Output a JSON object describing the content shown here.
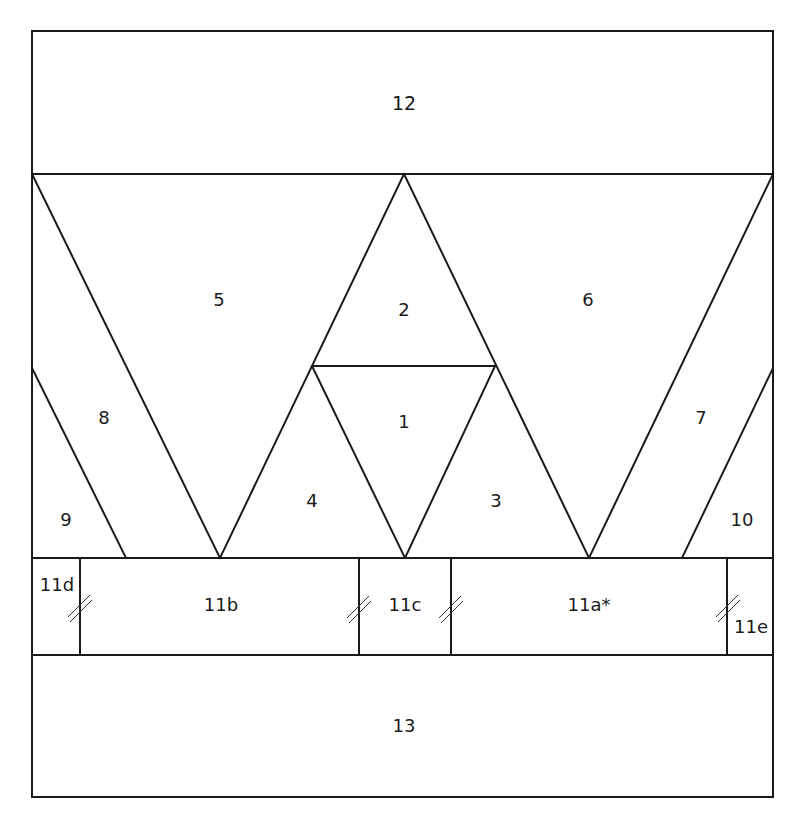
{
  "diagram": {
    "type": "foundation-paper-piecing-pattern",
    "stroke_color": "#1a1a1a",
    "background": "#ffffff",
    "pieces": [
      {
        "id": "12",
        "label": "12",
        "x": 404,
        "y": 104
      },
      {
        "id": "5",
        "label": "5",
        "x": 219,
        "y": 301
      },
      {
        "id": "2",
        "label": "2",
        "x": 404,
        "y": 311
      },
      {
        "id": "6",
        "label": "6",
        "x": 588,
        "y": 301
      },
      {
        "id": "8",
        "label": "8",
        "x": 104,
        "y": 419
      },
      {
        "id": "1",
        "label": "1",
        "x": 404,
        "y": 423
      },
      {
        "id": "7",
        "label": "7",
        "x": 701,
        "y": 419
      },
      {
        "id": "4",
        "label": "4",
        "x": 312,
        "y": 502
      },
      {
        "id": "3",
        "label": "3",
        "x": 496,
        "y": 502
      },
      {
        "id": "9",
        "label": "9",
        "x": 66,
        "y": 521
      },
      {
        "id": "10",
        "label": "10",
        "x": 742,
        "y": 521
      },
      {
        "id": "11d",
        "label": "11d",
        "x": 57,
        "y": 586
      },
      {
        "id": "11b",
        "label": "11b",
        "x": 221,
        "y": 606
      },
      {
        "id": "11c",
        "label": "11c",
        "x": 405,
        "y": 606
      },
      {
        "id": "11a",
        "label": "11a*",
        "x": 589,
        "y": 606
      },
      {
        "id": "11e",
        "label": "11e",
        "x": 751,
        "y": 628
      },
      {
        "id": "13",
        "label": "13",
        "x": 404,
        "y": 727
      }
    ],
    "seam_allowance_marks": [
      {
        "between": "11d-11b",
        "x": 80,
        "y": 606
      },
      {
        "between": "11b-11c",
        "x": 359,
        "y": 606
      },
      {
        "between": "11c-11a",
        "x": 451,
        "y": 606
      },
      {
        "between": "11a-11e",
        "x": 727,
        "y": 606
      }
    ]
  }
}
